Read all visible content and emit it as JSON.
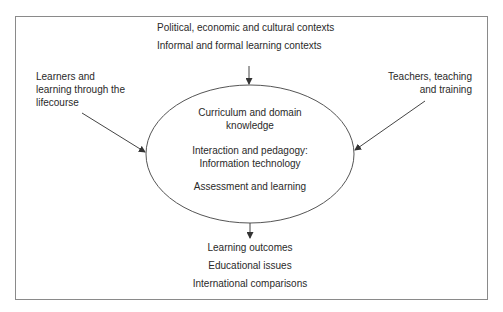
{
  "diagram": {
    "top_contexts": [
      "Political, economic and cultural contexts",
      "Informal and formal learning contexts"
    ],
    "left_input": {
      "lines": [
        "Learners and",
        "learning through the",
        "lifecourse"
      ]
    },
    "right_input": {
      "lines": [
        "Teachers, teaching",
        "and training"
      ]
    },
    "core": {
      "items": [
        [
          "Curriculum and domain",
          "knowledge"
        ],
        [
          "Interaction and pedagogy:",
          "Information technology"
        ],
        [
          "Assessment and learning"
        ]
      ]
    },
    "outputs": [
      "Learning outcomes",
      "Educational issues",
      "International comparisons"
    ],
    "colors": {
      "frame": "#8a8a8a",
      "lines": "#444444",
      "text": "#2a2a2a"
    }
  }
}
